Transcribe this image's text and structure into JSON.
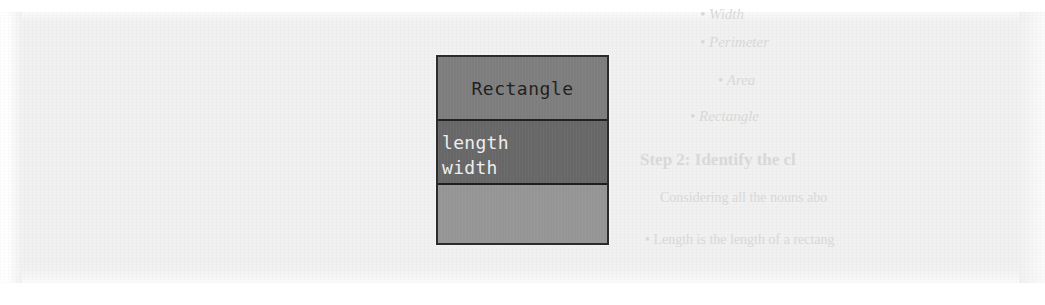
{
  "page": {
    "background_color": "#f1f1f1",
    "page_edge_color": "#ffffff"
  },
  "uml_class": {
    "name": "Rectangle",
    "header_color": "#7d7d7d",
    "attributes_color": "#676767",
    "methods_color": "#959595",
    "border_color": "#2b2b2b",
    "attribute_text_color": "#eeeeee",
    "name_text_color": "#1d1d1d",
    "attributes": [
      "length",
      "width"
    ],
    "methods": []
  },
  "background_showthrough": {
    "color": "#d8d8d8",
    "lines": [
      {
        "text": "•   Width",
        "x": 700,
        "y": 6,
        "style": "bullet-line"
      },
      {
        "text": "•   Perimeter",
        "x": 700,
        "y": 34,
        "style": "bullet-line"
      },
      {
        "text": "•   Area",
        "x": 718,
        "y": 72,
        "style": "bullet-line"
      },
      {
        "text": "•   Rectangle",
        "x": 690,
        "y": 108,
        "style": "bullet-line"
      },
      {
        "text": "Step 2: Identify the cl",
        "x": 640,
        "y": 150,
        "style": "heading"
      },
      {
        "text": "Considering all the nouns abo",
        "x": 660,
        "y": 190,
        "style": "body"
      },
      {
        "text": "•   Length is the length of a rectang",
        "x": 645,
        "y": 232,
        "style": "body"
      }
    ]
  }
}
